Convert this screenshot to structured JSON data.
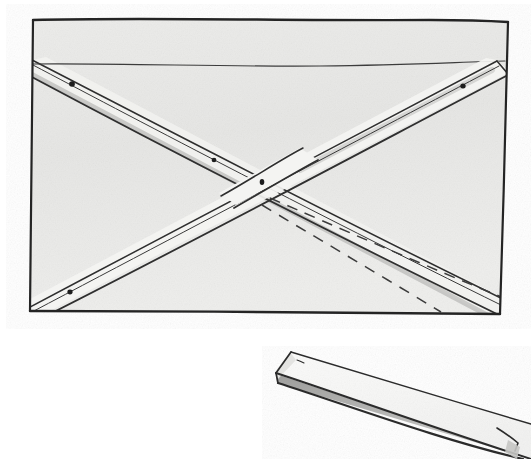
{
  "illustration": {
    "title": "Hand-drawn woodworking diagram: braced frame panel with loose batten",
    "medium": "pencil and grey wash on textured paper",
    "background_color": "#ffffff",
    "paper_wash_color": "#e8e8e6",
    "ink_color": "#2b2b2b",
    "shadow_color": "#9a9a98"
  },
  "figures": [
    {
      "id": "figure-top",
      "name": "braced-frame-panel",
      "description": "Rectangular panel seen flat, with two diagonal braces crossing in an X, a horizontal ledger near the top, four screw holes and two dashed layout lines",
      "frame": {
        "name": "panel-outline",
        "shape": "rectangle",
        "corners": [
          [
            33,
            19
          ],
          [
            508,
            22
          ],
          [
            500,
            314
          ],
          [
            30,
            311
          ]
        ]
      },
      "members": [
        {
          "name": "top-ledger",
          "kind": "horizontal-rail",
          "from": [
            32,
            64
          ],
          "to": [
            503,
            62
          ]
        },
        {
          "name": "brace-left-to-right-down",
          "kind": "diagonal-brace",
          "description": "runs from upper-left down to lower-right, passes under the other brace",
          "from": [
            33,
            63
          ],
          "to": [
            500,
            310
          ],
          "width_px": 17
        },
        {
          "name": "brace-right-to-left-down",
          "kind": "diagonal-brace",
          "description": "runs from upper-right down to lower-left, lies on top at the crossing",
          "from": [
            496,
            65
          ],
          "to": [
            34,
            309
          ],
          "width_px": 17
        }
      ],
      "fasteners": [
        {
          "name": "screw-hole-upper-left",
          "x": 72,
          "y": 84
        },
        {
          "name": "screw-hole-upper-right",
          "x": 463,
          "y": 86
        },
        {
          "name": "screw-hole-mid-left",
          "x": 214,
          "y": 160
        },
        {
          "name": "screw-hole-center",
          "x": 262,
          "y": 182
        },
        {
          "name": "screw-hole-lower-left",
          "x": 70,
          "y": 292
        }
      ],
      "layout_lines": [
        {
          "name": "dashed-layout-line-upper",
          "style": "dashed",
          "from": [
            268,
            200
          ],
          "to": [
            505,
            297
          ]
        },
        {
          "name": "dashed-layout-line-lower",
          "style": "dashed",
          "from": [
            261,
            206
          ],
          "to": [
            440,
            312
          ]
        }
      ]
    },
    {
      "id": "figure-bottom",
      "name": "loose-batten-board",
      "description": "A single long flat board drawn in perspective, running from upper-left to lower-right and cropped by the right edge of the sheet",
      "top_face": [
        [
          290,
          352
        ],
        [
          531,
          424
        ],
        [
          531,
          459
        ],
        [
          275,
          372
        ]
      ],
      "front_edge": [
        [
          275,
          372
        ],
        [
          531,
          459
        ],
        [
          531,
          459
        ],
        [
          275,
          382
        ]
      ],
      "end_chamfer": [
        [
          290,
          352
        ],
        [
          275,
          372
        ],
        [
          277,
          380
        ],
        [
          296,
          360
        ]
      ]
    }
  ],
  "annotations": {
    "visible_text": [],
    "labels": []
  }
}
